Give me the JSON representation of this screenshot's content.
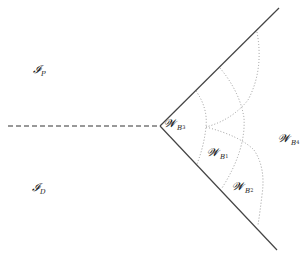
{
  "diagram": {
    "labels": {
      "ip": {
        "main": "𝓘",
        "sub": "P"
      },
      "id": {
        "main": "𝓘",
        "sub": "D"
      },
      "wb3": {
        "main": "𝓦",
        "sub": "B",
        "subsub": "3"
      },
      "wb1": {
        "main": "𝓦",
        "sub": "B",
        "subsub": "1"
      },
      "wb2": {
        "main": "𝓦",
        "sub": "B",
        "subsub": "2"
      },
      "wb4": {
        "main": "𝓦",
        "sub": "B",
        "subsub": "4"
      }
    },
    "colors": {
      "line": "#444444",
      "dashed": "#333333",
      "dotted": "#999999",
      "text": "#222222"
    }
  }
}
